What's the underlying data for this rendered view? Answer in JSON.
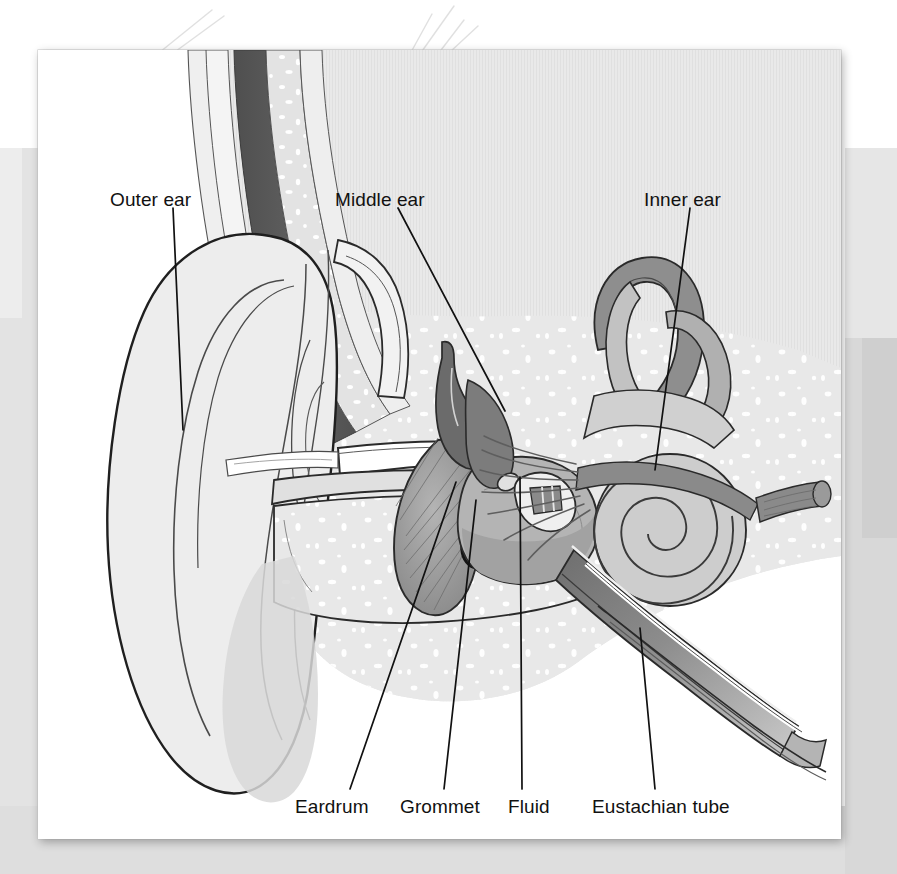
{
  "figure": {
    "kind": "anatomical-illustration",
    "style": "greyscale line drawing on a white card over a grey background"
  },
  "palette": {
    "card": "#ffffff",
    "background": "#ffffff",
    "background_band_left": "#e3e3e3",
    "background_band_bottom": "#dedede",
    "background_band_right": "#d8d8d8",
    "outline": "#3a3a3a",
    "outline_dark": "#1c1c1c",
    "skin_light": "#ededed",
    "bone_light": "#e6e6e6",
    "bone_mid": "#d8d8d8",
    "cartilage": "#c9c9c9",
    "muscle_dark": "#5a5a5a",
    "muscle_mid": "#8f8f8f",
    "cavity_grey": "#b9b9b9",
    "fluid_grey": "#a8a8a8",
    "eardrum": "#9a9a9a",
    "label_text": "#111111",
    "leader_line": "#111111",
    "speckle": "#ffffff"
  },
  "labels": {
    "top": [
      {
        "id": "outer-ear",
        "text": "Outer ear",
        "x": 110,
        "y": 200,
        "leader": {
          "x1": 173,
          "y1": 208,
          "x2": 183,
          "y2": 430
        }
      },
      {
        "id": "middle-ear",
        "text": "Middle ear",
        "x": 335,
        "y": 200,
        "leader": {
          "x1": 398,
          "y1": 208,
          "x2": 505,
          "y2": 411
        }
      },
      {
        "id": "inner-ear",
        "text": "Inner ear",
        "x": 644,
        "y": 200,
        "leader": {
          "x1": 690,
          "y1": 208,
          "x2": 655,
          "y2": 470
        }
      }
    ],
    "bottom": [
      {
        "id": "eardrum",
        "text": "Eardrum",
        "x": 295,
        "y": 807,
        "leader": {
          "x1": 350,
          "y1": 789,
          "x2": 456,
          "y2": 482
        }
      },
      {
        "id": "grommet",
        "text": "Grommet",
        "x": 400,
        "y": 807,
        "leader": {
          "x1": 444,
          "y1": 789,
          "x2": 476,
          "y2": 500
        }
      },
      {
        "id": "fluid",
        "text": "Fluid",
        "x": 508,
        "y": 807,
        "leader": {
          "x1": 522,
          "y1": 789,
          "x2": 520,
          "y2": 477
        }
      },
      {
        "id": "eustachian-tube",
        "text": "Eustachian tube",
        "x": 592,
        "y": 807,
        "leader": {
          "x1": 655,
          "y1": 789,
          "x2": 640,
          "y2": 628
        }
      }
    ]
  },
  "structures": [
    {
      "id": "pinna",
      "name": "Pinna (auricle)"
    },
    {
      "id": "ear-canal",
      "name": "External auditory canal"
    },
    {
      "id": "temporal-bone",
      "name": "Temporal bone"
    },
    {
      "id": "eardrum-membrane",
      "name": "Tympanic membrane"
    },
    {
      "id": "grommet-ring",
      "name": "Grommet / tympanostomy tube"
    },
    {
      "id": "middle-ear-cavity",
      "name": "Fluid-filled middle ear cavity"
    },
    {
      "id": "malleus",
      "name": "Malleus (hammer)"
    },
    {
      "id": "incus",
      "name": "Incus (anvil)"
    },
    {
      "id": "stapes",
      "name": "Stapes (stirrup)"
    },
    {
      "id": "semicircular-canals",
      "name": "Semicircular canals"
    },
    {
      "id": "cochlea",
      "name": "Cochlea"
    },
    {
      "id": "auditory-nerve",
      "name": "Auditory (vestibulocochlear) nerve"
    },
    {
      "id": "eustachian-tube-duct",
      "name": "Eustachian tube"
    },
    {
      "id": "scalp-muscle-band",
      "name": "Scalp and temporalis band"
    }
  ]
}
